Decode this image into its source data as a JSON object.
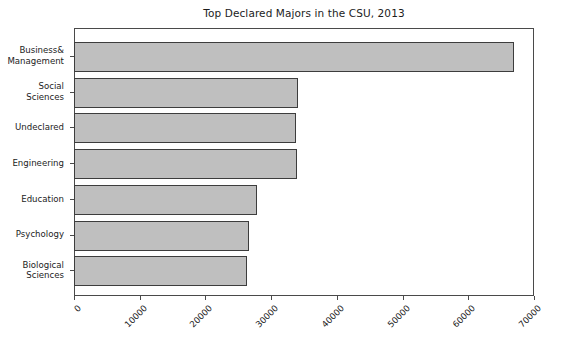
{
  "chart_data": {
    "type": "bar",
    "orientation": "horizontal",
    "title": "Top Declared Majors in the CSU, 2013",
    "xlabel": "",
    "ylabel": "",
    "categories": [
      "Business&\nManagement",
      "Social\nSciences",
      "Undeclared",
      "Engineering",
      "Education",
      "Psychology",
      "Biological\nSciences"
    ],
    "category_lines": [
      [
        "Business&",
        "Management"
      ],
      [
        "Social",
        "Sciences"
      ],
      [
        "Undeclared"
      ],
      [
        "Engineering"
      ],
      [
        "Education"
      ],
      [
        "Psychology"
      ],
      [
        "Biological",
        "Sciences"
      ]
    ],
    "values": [
      66800,
      33900,
      33700,
      33800,
      27700,
      26500,
      26200
    ],
    "xlim": [
      0,
      70000
    ],
    "xticks": [
      0,
      10000,
      20000,
      30000,
      40000,
      50000,
      60000,
      70000
    ],
    "xtick_labels": [
      "0",
      "10000",
      "20000",
      "30000",
      "40000",
      "50000",
      "60000",
      "70000"
    ],
    "xtick_rotation": -45,
    "grid": false,
    "legend": null,
    "bar_fill_color": "#bfbfbf",
    "bar_edge_color": "#3d3d3d",
    "axis_color": "#4a4a4a",
    "background_color": "#ffffff"
  }
}
